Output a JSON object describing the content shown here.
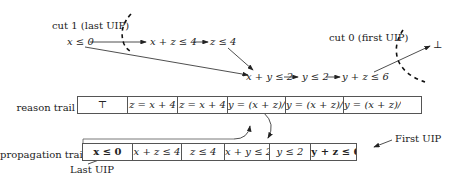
{
  "graph": {
    "cut1_label": "cut 1 (last UIP)",
    "cut0_label": "cut 0 (first UIP)",
    "nodes": {
      "n1": "x ≤ 0",
      "n2": "x + z ≤ 4",
      "n3": "z ≤ 4",
      "n4": "x + y ≤ 2",
      "n5": "y ≤ 2",
      "n6": "y + z ≤ 6",
      "n7": "⊥"
    }
  },
  "reason_trail": {
    "label": "reason trail",
    "cells": [
      "⊤",
      "z = x + 4",
      "z = x + 4",
      "y = (x + z)/2",
      "y = (x + z)/2",
      "y = (x + z)/2"
    ]
  },
  "propagation_trail": {
    "label": "propagation trail",
    "cells": [
      "x ≤ 0",
      "x + z ≤ 4",
      "z ≤ 4",
      "x + y ≤ 2",
      "y ≤ 2",
      "y + z ≤ 6"
    ]
  },
  "annotations": {
    "first_uip": "First UIP",
    "last_uip": "Last UIP"
  }
}
